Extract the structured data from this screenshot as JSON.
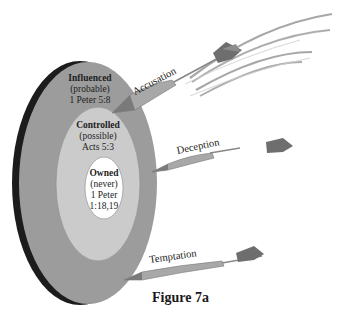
{
  "figure": {
    "caption": "Figure 7a",
    "colors": {
      "rim": "#1c1c1c",
      "outer_ring": "#9c9c9c",
      "middle_ring": "#cbcbcb",
      "inner_ring": "#ffffff",
      "dart": "#a8a8a8",
      "fletching": "#6e6e6e",
      "trail": "#8a8a8a"
    }
  },
  "rings": {
    "outer": {
      "title": "Influenced",
      "qualifier": "(probable)",
      "reference": "1 Peter 5:8"
    },
    "middle": {
      "title": "Controlled",
      "qualifier": "(possible)",
      "reference": "Acts 5:3"
    },
    "inner": {
      "title": "Owned",
      "qualifier": "(never)",
      "reference_line1": "1 Peter",
      "reference_line2": "1:18,19"
    }
  },
  "darts": [
    {
      "label": "Accusation"
    },
    {
      "label": "Deception"
    },
    {
      "label": "Temptation"
    }
  ]
}
